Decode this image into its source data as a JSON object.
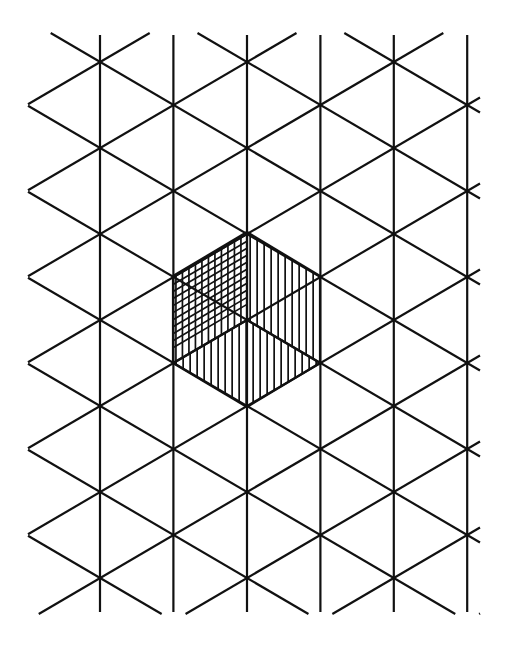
{
  "figure": {
    "canvas": {
      "width": 507,
      "height": 654,
      "background": "#ffffff"
    },
    "stroke": {
      "color": "#111111",
      "grid_width": 2.2,
      "hatch_width": 1.7
    }
  },
  "lattice": {
    "type": "triangular-isometric",
    "origin": {
      "x": 247,
      "y": 320
    },
    "column_spacing": 73.4,
    "row_spacing": 86.0,
    "column_x": [
      26.6,
      100.0,
      173.4,
      247.0,
      320.4,
      393.8,
      467.2
    ],
    "row_y": [
      60,
      103,
      146,
      189,
      232,
      275,
      318,
      361,
      404,
      447,
      490,
      533,
      576
    ],
    "vertical_line_count": 6,
    "vertical_line_top": 35,
    "vertical_line_bottom": 612,
    "clip": {
      "left": 28,
      "right": 480,
      "top": 33,
      "bottom": 614
    },
    "families": [
      {
        "name": "vertical",
        "label": "vertical lines",
        "angle_deg": 90
      },
      {
        "name": "down-right",
        "label": "lines descending to the right",
        "angle_deg": -30
      },
      {
        "name": "up-right",
        "label": "lines ascending to the right",
        "angle_deg": 30
      }
    ]
  },
  "hexagon": {
    "name": "shaded-hexagon",
    "center": {
      "x": 247,
      "y": 320
    },
    "vertices": [
      {
        "name": "top",
        "x": 247,
        "y": 232
      },
      {
        "name": "upper-right",
        "x": 320,
        "y": 276
      },
      {
        "name": "lower-right",
        "x": 320,
        "y": 363
      },
      {
        "name": "bottom",
        "x": 247,
        "y": 407
      },
      {
        "name": "lower-left",
        "x": 173,
        "y": 363
      },
      {
        "name": "upper-left",
        "x": 173,
        "y": 276
      }
    ],
    "faces": [
      {
        "name": "upper-left-rhombus",
        "label": "top-left face (cross-hatched)",
        "hatch": "cross",
        "hatch_spacing": 6.5,
        "points": "173,276 247,232 247,320 173,363"
      },
      {
        "name": "upper-right-rhombus",
        "label": "top-right face (vertical hatching)",
        "hatch": "vertical",
        "hatch_spacing": 7.0,
        "points": "247,232 320,276 320,363 247,320"
      },
      {
        "name": "bottom-rhombus",
        "label": "bottom face (vertical hatching)",
        "hatch": "vertical",
        "hatch_spacing": 7.0,
        "points": "173,363 247,320 320,363 247,407"
      }
    ]
  }
}
